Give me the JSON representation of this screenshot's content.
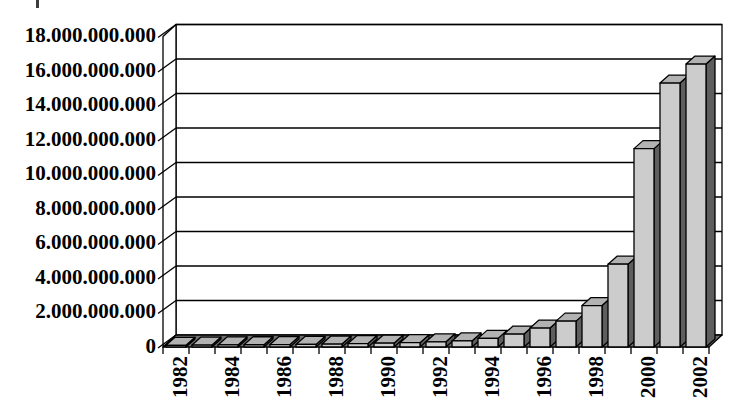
{
  "figure": {
    "kind": "scanned 3d bar chart, no title, no legend",
    "background": "#ffffff"
  },
  "chart_data": {
    "type": "bar",
    "style": "3d",
    "title": "",
    "xlabel": "",
    "ylabel": "",
    "categories": [
      "1982",
      "1983",
      "1984",
      "1985",
      "1986",
      "1987",
      "1988",
      "1989",
      "1990",
      "1991",
      "1992",
      "1993",
      "1994",
      "1995",
      "1996",
      "1997",
      "1998",
      "1999",
      "2000",
      "2001",
      "2002"
    ],
    "values": [
      100000000,
      110000000,
      120000000,
      130000000,
      140000000,
      150000000,
      170000000,
      200000000,
      220000000,
      250000000,
      300000000,
      350000000,
      500000000,
      750000000,
      1100000000,
      1500000000,
      2400000000,
      4800000000,
      11500000000,
      15300000000,
      16400000000
    ],
    "x_axis": {
      "labels_shown": [
        "1982",
        "1984",
        "1986",
        "1988",
        "1990",
        "1992",
        "1994",
        "1996",
        "1998",
        "2000",
        "2002"
      ],
      "label_every_n_years": 2,
      "tick_label_rotation_deg": 90
    },
    "y_axis": {
      "min": 0,
      "max": 18000000000,
      "step": 2000000000,
      "tick_labels": [
        "0",
        "2.000.000.000",
        "4.000.000.000",
        "6.000.000.000",
        "8.000.000.000",
        "10.000.000.000",
        "12.000.000.000",
        "14.000.000.000",
        "16.000.000.000",
        "18.000.000.000"
      ],
      "number_format": "dot thousands separator"
    },
    "grid": true,
    "legend": false,
    "legend_position": "none",
    "colors": {
      "bar_front": "#cccccc",
      "bar_top": "#b2b2b2",
      "bar_side": "#5e5e5e",
      "floor": "#6f6f6f",
      "wall": "#ffffff",
      "line": "#000000",
      "text": "#000000"
    }
  }
}
